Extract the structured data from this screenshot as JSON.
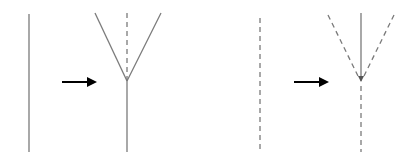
{
  "diagram": {
    "colors": {
      "line": "#7a7a7a",
      "arrow": "#000000",
      "background": "#ffffff"
    },
    "panels": [
      {
        "name": "left-panel",
        "before": {
          "style": "solid",
          "x": 29,
          "y1": 14,
          "y2": 152
        },
        "arrow": {
          "x1": 62,
          "x2": 95,
          "y": 82
        },
        "after": {
          "apex": [
            127,
            81
          ],
          "branches": [
            {
              "from": [
                95,
                13
              ],
              "style": "solid"
            },
            {
              "from": [
                161,
                13
              ],
              "style": "solid"
            }
          ],
          "center_top": {
            "style": "dashed",
            "y1": 13
          },
          "stem": {
            "style": "solid",
            "y2": 152
          }
        }
      },
      {
        "name": "right-panel",
        "before": {
          "style": "dashed",
          "x": 260,
          "y1": 18,
          "y2": 152
        },
        "arrow": {
          "x1": 294,
          "x2": 327,
          "y": 82
        },
        "after": {
          "apex": [
            361,
            81
          ],
          "branches": [
            {
              "from": [
                328,
                15
              ],
              "style": "dashed"
            },
            {
              "from": [
                394,
                15
              ],
              "style": "dashed"
            }
          ],
          "center_top": {
            "style": "solid-with-arrowhead",
            "y1": 13
          },
          "stem": {
            "style": "dashed",
            "y2": 152
          }
        }
      }
    ]
  }
}
